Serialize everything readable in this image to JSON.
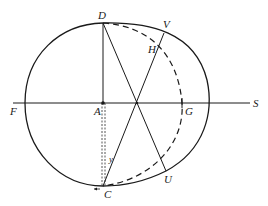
{
  "diagram": {
    "type": "geometric-orbit-figure",
    "stroke_color": "#1a1a1a",
    "labels": {
      "D": "D",
      "V": "V",
      "H": "H",
      "F": "F",
      "A": "A",
      "G": "G",
      "S": "S",
      "y": "y",
      "C": "C",
      "U": "U"
    }
  }
}
